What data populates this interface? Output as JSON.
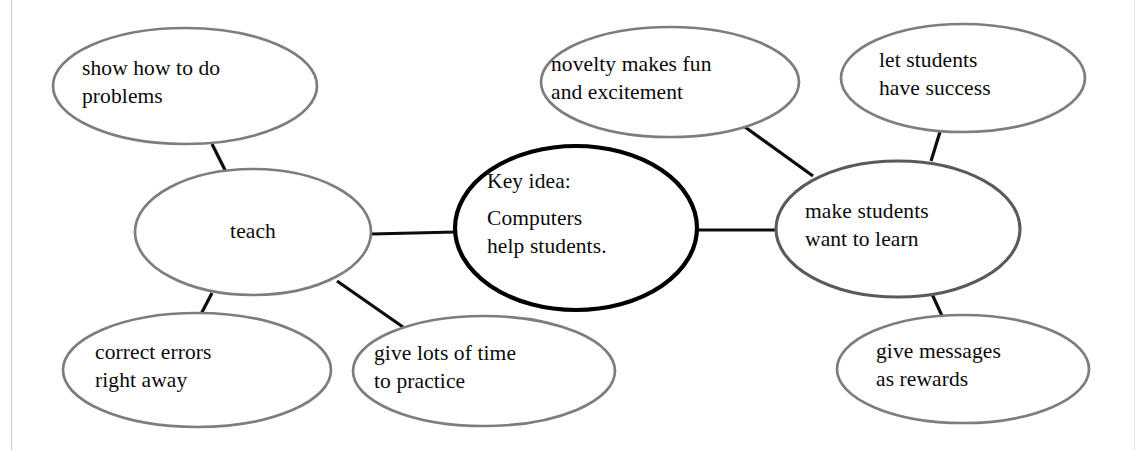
{
  "diagram": {
    "type": "concept-map",
    "background_color": "#ffffff",
    "frame_color": "#c9c9c9",
    "node_border_color": "#7d7d7d",
    "node_border_color_emphasis": "#5a5a5a",
    "center_border_color": "#000000",
    "connector_color": "#0d0d0d",
    "text_color": "#0a0a0a"
  },
  "nodes": {
    "center": {
      "id": "center",
      "heading": "Key idea:",
      "line1": "Computers",
      "line2": "help students.",
      "cx": 576,
      "cy": 228,
      "rx": 121,
      "ry": 82,
      "emphasis": "true"
    },
    "teach": {
      "id": "teach",
      "line1": "teach",
      "cx": 253,
      "cy": 232,
      "rx": 118,
      "ry": 63
    },
    "show_how": {
      "id": "show-how-to-do-problems",
      "line1": "show how to do",
      "line2": "problems",
      "cx": 185,
      "cy": 86,
      "rx": 132,
      "ry": 58
    },
    "correct_errors": {
      "id": "correct-errors-right-away",
      "line1": "correct errors",
      "line2": "right away",
      "cx": 197,
      "cy": 370,
      "rx": 134,
      "ry": 57
    },
    "give_time": {
      "id": "give-lots-of-time-to-practice",
      "line1": "give lots of time",
      "line2": "to practice",
      "cx": 484,
      "cy": 371,
      "rx": 131,
      "ry": 55
    },
    "novelty": {
      "id": "novelty-makes-fun-and-excitement",
      "line1": "novelty makes fun",
      "line2": "and excitement",
      "cx": 670,
      "cy": 82,
      "rx": 129,
      "ry": 55
    },
    "let_success": {
      "id": "let-students-have-success",
      "line1": "let students",
      "line2": "have success",
      "cx": 963,
      "cy": 78,
      "rx": 122,
      "ry": 54
    },
    "make_want": {
      "id": "make-students-want-to-learn",
      "line1": "make students",
      "line2": "want to learn",
      "cx": 898,
      "cy": 229,
      "rx": 122,
      "ry": 68,
      "emphasis": "true"
    },
    "give_messages": {
      "id": "give-messages-as-rewards",
      "line1": "give messages",
      "line2": "as rewards",
      "cx": 963,
      "cy": 369,
      "rx": 126,
      "ry": 54
    }
  },
  "connectors": [
    {
      "from": "teach",
      "to": "center",
      "x1": 371,
      "y1": 234,
      "x2": 456,
      "y2": 232
    },
    {
      "from": "center",
      "to": "make_want",
      "x1": 697,
      "y1": 230,
      "x2": 778,
      "y2": 230
    },
    {
      "from": "show_how",
      "to": "teach",
      "x1": 212,
      "y1": 144,
      "x2": 226,
      "y2": 172
    },
    {
      "from": "teach",
      "to": "correct_errors",
      "x1": 212,
      "y1": 293,
      "x2": 200,
      "y2": 316
    },
    {
      "from": "teach",
      "to": "give_time",
      "x1": 337,
      "y1": 281,
      "x2": 403,
      "y2": 327
    },
    {
      "from": "novelty",
      "to": "make_want",
      "x1": 745,
      "y1": 127,
      "x2": 813,
      "y2": 176
    },
    {
      "from": "let_success",
      "to": "make_want",
      "x1": 940,
      "y1": 132,
      "x2": 931,
      "y2": 161
    },
    {
      "from": "make_want",
      "to": "give_messages",
      "x1": 932,
      "y1": 294,
      "x2": 943,
      "y2": 318
    }
  ]
}
